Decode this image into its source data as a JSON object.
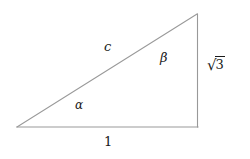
{
  "figure": {
    "background_color": "#ffffff",
    "stroke_color": "#999999",
    "text_color": "#1a1a1a",
    "width": 250,
    "height": 159
  },
  "geometry": {
    "vertices": {
      "bottom_left": {
        "x": 17,
        "y": 127
      },
      "bottom_right": {
        "x": 198,
        "y": 127
      },
      "top_right": {
        "x": 197,
        "y": 14
      }
    },
    "sides": [
      {
        "name": "base",
        "from": "bottom_left",
        "to": "bottom_right",
        "label": "1"
      },
      {
        "name": "vertical",
        "from": "bottom_right",
        "to": "top_right",
        "label": "sqrt3"
      },
      {
        "name": "hypotenuse",
        "from": "bottom_left",
        "to": "top_right",
        "label": "c"
      }
    ]
  },
  "labels": {
    "hypotenuse": "c",
    "angle_alpha": "α",
    "angle_beta": "β",
    "base": "1",
    "height_radix": "√",
    "height_radicand": "3"
  }
}
